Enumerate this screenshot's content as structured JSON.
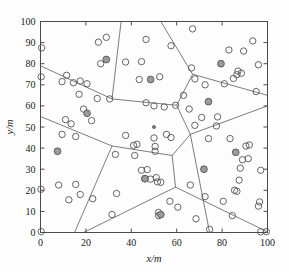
{
  "figure": {
    "title": "",
    "background_color": "#fdfdfd"
  },
  "chart_data": {
    "type": "scatter",
    "title": "",
    "subtitle": "",
    "xlabel": "x/m",
    "ylabel": "y/m",
    "xlim": [
      0,
      100
    ],
    "ylim": [
      0,
      100
    ],
    "xticks": [
      0,
      20,
      40,
      60,
      80,
      100
    ],
    "yticks": [
      0,
      10,
      20,
      30,
      40,
      50,
      60,
      70,
      80,
      90,
      100
    ],
    "xtick_labels": [
      "0",
      "20",
      "40",
      "60",
      "80",
      "100"
    ],
    "ytick_labels": [
      "0",
      "10",
      "20",
      "30",
      "40",
      "50",
      "60",
      "70",
      "80",
      "90",
      "100"
    ],
    "grid": false,
    "legend": null,
    "legend_position": "none",
    "colors": {
      "node_stroke": "#555555",
      "cluster_head_fill": "#9a9a9a",
      "voronoi_edge": "#6e6e6e",
      "axis": "#4a4a4a",
      "sink": "#7a7a7a"
    },
    "series": [
      {
        "name": "sensor-node",
        "marker": "open-circle",
        "marker_size": 3.2,
        "points": [
          [
            0.5,
            87.5
          ],
          [
            0.3,
            73.8
          ],
          [
            0.2,
            20.5
          ],
          [
            0.3,
            0.4
          ],
          [
            29.0,
            92.5
          ],
          [
            25.5,
            90.2
          ],
          [
            37.5,
            80.8
          ],
          [
            44.5,
            81.0
          ],
          [
            46.5,
            91.5
          ],
          [
            57.5,
            88.5
          ],
          [
            67.0,
            96.5
          ],
          [
            93.5,
            90.8
          ],
          [
            89.5,
            86.0
          ],
          [
            83.0,
            86.5
          ],
          [
            96.0,
            79.5
          ],
          [
            87.0,
            76.5
          ],
          [
            86.5,
            74.8
          ],
          [
            88.5,
            75.5
          ],
          [
            85.0,
            73.0
          ],
          [
            81.0,
            70.5
          ],
          [
            72.5,
            70.0
          ],
          [
            68.0,
            72.8
          ],
          [
            95.0,
            66.8
          ],
          [
            66.5,
            78.0
          ],
          [
            63.0,
            65.0
          ],
          [
            65.5,
            58.5
          ],
          [
            71.0,
            54.5
          ],
          [
            68.0,
            50.8
          ],
          [
            11.5,
            74.5
          ],
          [
            9.5,
            71.5
          ],
          [
            14.5,
            71.0
          ],
          [
            17.5,
            71.8
          ],
          [
            20.5,
            70.5
          ],
          [
            17.0,
            65.5
          ],
          [
            25.0,
            63.5
          ],
          [
            30.5,
            63.3
          ],
          [
            43.5,
            72.5
          ],
          [
            52.5,
            73.8
          ],
          [
            46.5,
            61.5
          ],
          [
            50.0,
            60.0
          ],
          [
            54.5,
            59.5
          ],
          [
            59.5,
            60.3
          ],
          [
            11.0,
            53.5
          ],
          [
            13.5,
            51.5
          ],
          [
            9.5,
            46.5
          ],
          [
            15.5,
            45.5
          ],
          [
            37.5,
            46.0
          ],
          [
            41.0,
            41.3
          ],
          [
            42.5,
            41.8
          ],
          [
            50.0,
            44.8
          ],
          [
            50.5,
            40.8
          ],
          [
            50.5,
            38.5
          ],
          [
            55.5,
            46.5
          ],
          [
            57.5,
            45.0
          ],
          [
            33.0,
            37.0
          ],
          [
            41.5,
            36.5
          ],
          [
            44.5,
            29.5
          ],
          [
            47.0,
            29.8
          ],
          [
            46.0,
            25.5
          ],
          [
            48.5,
            25.3
          ],
          [
            51.0,
            26.0
          ],
          [
            51.5,
            24.0
          ],
          [
            53.0,
            23.8
          ],
          [
            8.0,
            22.5
          ],
          [
            15.5,
            22.8
          ],
          [
            12.5,
            15.5
          ],
          [
            17.5,
            18.0
          ],
          [
            23.0,
            16.0
          ],
          [
            31.5,
            8.5
          ],
          [
            52.0,
            9.5
          ],
          [
            52.0,
            8.0
          ],
          [
            57.0,
            14.8
          ],
          [
            60.5,
            12.0
          ],
          [
            66.0,
            22.5
          ],
          [
            68.5,
            6.5
          ],
          [
            72.5,
            17.0
          ],
          [
            74.5,
            1.5
          ],
          [
            80.5,
            14.8
          ],
          [
            84.5,
            8.0
          ],
          [
            87.5,
            24.8
          ],
          [
            85.5,
            20.0
          ],
          [
            86.5,
            19.5
          ],
          [
            90.5,
            41.0
          ],
          [
            92.0,
            41.5
          ],
          [
            89.0,
            34.5
          ],
          [
            91.5,
            35.0
          ],
          [
            88.0,
            30.5
          ],
          [
            97.0,
            29.5
          ],
          [
            96.5,
            14.5
          ],
          [
            96.0,
            12.5
          ],
          [
            97.0,
            0.3
          ],
          [
            99.5,
            0.4
          ],
          [
            83.5,
            44.5
          ],
          [
            78.0,
            54.8
          ],
          [
            77.5,
            50.5
          ],
          [
            74.0,
            44.5
          ],
          [
            22.5,
            53.0
          ],
          [
            19.0,
            58.5
          ],
          [
            33.5,
            18.5
          ],
          [
            26.5,
            80.0
          ]
        ]
      },
      {
        "name": "cluster-head",
        "marker": "filled-circle",
        "marker_size": 3.4,
        "points": [
          [
            29.0,
            82.0
          ],
          [
            79.5,
            80.0
          ],
          [
            48.5,
            72.5
          ],
          [
            74.0,
            62.0
          ],
          [
            20.5,
            56.5
          ],
          [
            7.5,
            38.5
          ],
          [
            72.0,
            30.0
          ],
          [
            86.0,
            38.0
          ],
          [
            46.0,
            25.5
          ],
          [
            53.0,
            8.5
          ]
        ]
      },
      {
        "name": "sink",
        "marker": "small-dot",
        "marker_size": 1.6,
        "points": [
          [
            50.0,
            50.0
          ]
        ]
      }
    ],
    "voronoi_edges": [
      [
        [
          0.0,
          79.0
        ],
        [
          31.5,
          63.3
        ],
        [
          48.5,
          61.5
        ],
        [
          60.0,
          60.3
        ]
      ],
      [
        [
          35.5,
          100.0
        ],
        [
          31.5,
          63.3
        ]
      ],
      [
        [
          53.0,
          100.0
        ],
        [
          67.0,
          75.0
        ],
        [
          60.0,
          60.3
        ]
      ],
      [
        [
          67.0,
          75.0
        ],
        [
          100.0,
          65.0
        ]
      ],
      [
        [
          60.0,
          60.3
        ],
        [
          66.0,
          46.5
        ],
        [
          100.0,
          60.0
        ]
      ],
      [
        [
          0.0,
          55.0
        ],
        [
          31.5,
          41.0
        ],
        [
          58.0,
          36.5
        ],
        [
          66.0,
          46.5
        ]
      ],
      [
        [
          31.5,
          41.0
        ],
        [
          15.0,
          0.0
        ]
      ],
      [
        [
          58.0,
          36.5
        ],
        [
          59.5,
          21.5
        ],
        [
          100.0,
          0.3
        ]
      ],
      [
        [
          59.5,
          21.5
        ],
        [
          19.0,
          0.0
        ]
      ],
      [
        [
          66.0,
          46.5
        ],
        [
          74.5,
          0.0
        ]
      ]
    ]
  },
  "axes": {
    "x_title": "x/m",
    "y_title": "y/m"
  }
}
